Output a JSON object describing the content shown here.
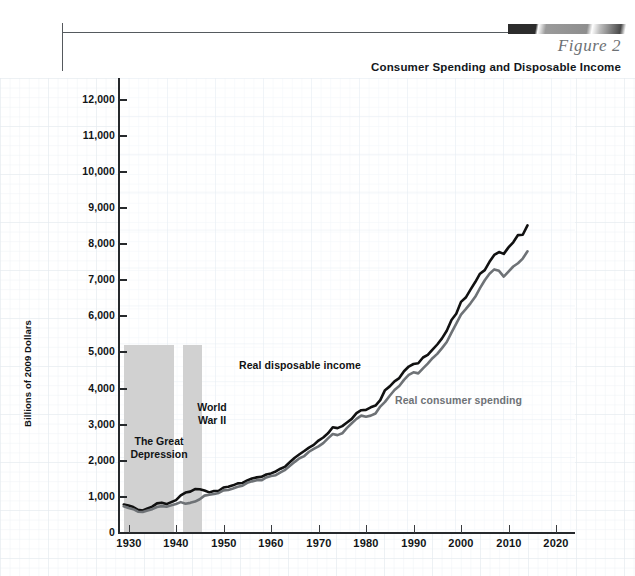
{
  "header": {
    "figure_label": "Figure 2",
    "figure_title": "Consumer Spending and Disposable Income"
  },
  "chart_data": {
    "type": "line",
    "title": "Consumer Spending and Disposable Income",
    "xlabel": "",
    "ylabel": "Billions of 2009 Dollars",
    "xlim": [
      1928,
      2024
    ],
    "ylim": [
      0,
      12600
    ],
    "grid": true,
    "legend": "inline-annotations",
    "ytick_labels": [
      "0",
      "1,000",
      "2,000",
      "3,000",
      "4,000",
      "5,000",
      "6,000",
      "7,000",
      "8,000",
      "9,000",
      "10,000",
      "11,000",
      "12,000"
    ],
    "ytick_values": [
      0,
      1000,
      2000,
      3000,
      4000,
      5000,
      6000,
      7000,
      8000,
      9000,
      10000,
      11000,
      12000
    ],
    "xtick_labels": [
      "1930",
      "1940",
      "1950",
      "1960",
      "1970",
      "1980",
      "1990",
      "2000",
      "2010",
      "2020"
    ],
    "xtick_values": [
      1930,
      1940,
      1950,
      1960,
      1970,
      1980,
      1990,
      2000,
      2010,
      2020
    ],
    "shaded_regions": [
      {
        "label": "The Great\nDepression",
        "label_line1": "The Great",
        "label_line2": "Depression",
        "start": 1929,
        "end": 1939.5,
        "color": "#cfcfcf"
      },
      {
        "label": "World\nWar II",
        "label_line1": "World",
        "label_line2": "War II",
        "start": 1941.5,
        "end": 1945.5,
        "color": "#cfcfcf"
      }
    ],
    "x": [
      1929,
      1930,
      1931,
      1932,
      1933,
      1934,
      1935,
      1936,
      1937,
      1938,
      1939,
      1940,
      1941,
      1942,
      1943,
      1944,
      1945,
      1946,
      1947,
      1948,
      1949,
      1950,
      1951,
      1952,
      1953,
      1954,
      1955,
      1956,
      1957,
      1958,
      1959,
      1960,
      1961,
      1962,
      1963,
      1964,
      1965,
      1966,
      1967,
      1968,
      1969,
      1970,
      1971,
      1972,
      1973,
      1974,
      1975,
      1976,
      1977,
      1978,
      1979,
      1980,
      1981,
      1982,
      1983,
      1984,
      1985,
      1986,
      1987,
      1988,
      1989,
      1990,
      1991,
      1992,
      1993,
      1994,
      1995,
      1996,
      1997,
      1998,
      1999,
      2000,
      2001,
      2002,
      2003,
      2004,
      2005,
      2006,
      2007,
      2008,
      2009,
      2010,
      2011,
      2012,
      2013,
      2014
    ],
    "series": [
      {
        "name": "Real disposable income",
        "color": "#111111",
        "values": [
          790,
          760,
          720,
          640,
          625,
          680,
          730,
          820,
          840,
          800,
          855,
          910,
          1040,
          1120,
          1145,
          1215,
          1210,
          1175,
          1125,
          1165,
          1170,
          1260,
          1280,
          1320,
          1375,
          1385,
          1455,
          1510,
          1540,
          1555,
          1620,
          1650,
          1705,
          1780,
          1840,
          1965,
          2085,
          2180,
          2270,
          2365,
          2440,
          2560,
          2645,
          2760,
          2930,
          2905,
          2960,
          3060,
          3160,
          3320,
          3400,
          3410,
          3480,
          3530,
          3680,
          3955,
          4060,
          4200,
          4290,
          4480,
          4610,
          4680,
          4700,
          4860,
          4930,
          5075,
          5220,
          5390,
          5600,
          5900,
          6070,
          6400,
          6520,
          6740,
          6950,
          7180,
          7280,
          7510,
          7700,
          7780,
          7730,
          7910,
          8050,
          8250,
          8260,
          8520
        ]
      },
      {
        "name": "Real consumer spending",
        "color": "#6e7276",
        "values": [
          740,
          690,
          660,
          590,
          580,
          620,
          660,
          720,
          745,
          725,
          765,
          805,
          855,
          810,
          835,
          870,
          935,
          1035,
          1060,
          1080,
          1110,
          1180,
          1190,
          1230,
          1280,
          1310,
          1390,
          1430,
          1460,
          1460,
          1540,
          1580,
          1600,
          1680,
          1750,
          1860,
          1970,
          2070,
          2130,
          2250,
          2330,
          2400,
          2490,
          2620,
          2740,
          2710,
          2760,
          2910,
          3040,
          3160,
          3250,
          3220,
          3250,
          3310,
          3500,
          3630,
          3800,
          3960,
          4070,
          4240,
          4380,
          4450,
          4420,
          4560,
          4690,
          4840,
          4960,
          5120,
          5290,
          5550,
          5800,
          6050,
          6200,
          6360,
          6540,
          6780,
          7000,
          7180,
          7300,
          7260,
          7100,
          7240,
          7380,
          7470,
          7600,
          7800
        ]
      }
    ]
  },
  "annotations": {
    "great_depression_line1": "The Great",
    "great_depression_line2": "Depression",
    "world_war_line1": "World",
    "world_war_line2": "War II",
    "income_label": "Real disposable income",
    "spending_label": "Real consumer spending"
  },
  "colors": {
    "income_line": "#111111",
    "spending_line": "#6e7276",
    "band": "#cfcfcf",
    "axis": "#26292c",
    "grid": "#e9eef2",
    "figure_label": "#6d7174"
  }
}
